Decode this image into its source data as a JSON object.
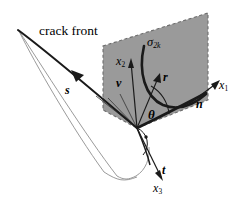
{
  "figure": {
    "kind": "crack-front-coordinate-diagram",
    "colors": {
      "background": "#ffffff",
      "plane_fill": "#9a9a9a",
      "plane_border": "#6e6e6e",
      "line": "#1a1a1a",
      "thin_surface_line": "#8e8e8e"
    },
    "labels": {
      "crack_front": "crack front",
      "s": "s",
      "sigma": "σ",
      "sigma_subscript": "2k",
      "x2": "x",
      "x2_subscript": "2",
      "v": "v",
      "r": "r",
      "theta": "θ",
      "n": "n",
      "x1": "x",
      "x1_subscript": "1",
      "t": "t",
      "x3": "x",
      "x3_subscript": "3"
    },
    "elements": {
      "plane": "dashed-bordered gray quadrilateral normal to the crack front",
      "stress_curve": "thick black U-shaped curve representing the sigma-2k stress distribution",
      "crack_surface": "thin gray outlined crack flank surface",
      "right_angle_marker": "quarter-arc with dot below the origin indicating a right angle"
    }
  }
}
